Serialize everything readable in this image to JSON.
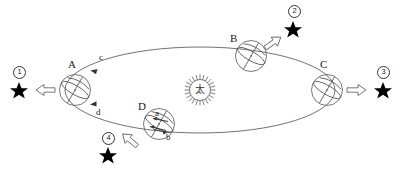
{
  "diagram": {
    "sun": {
      "symbol": "太",
      "label_name": "sun-symbol",
      "cx": 200,
      "cy": 90,
      "r": 13
    },
    "orbit": {
      "cx": 200,
      "cy": 90,
      "rx": 135,
      "ry": 43,
      "stroke": "#4d4d4d"
    },
    "earth_positions": [
      {
        "id": "A",
        "label": "A",
        "cx": 75,
        "cy": 90,
        "r": 16,
        "label_x": 68,
        "label_y": 62
      },
      {
        "id": "B",
        "label": "B",
        "cx": 251,
        "cy": 56,
        "r": 16,
        "label_x": 231,
        "label_y": 36
      },
      {
        "id": "C",
        "label": "C",
        "cx": 327,
        "cy": 90,
        "r": 16,
        "label_x": 320,
        "label_y": 62
      },
      {
        "id": "D",
        "label": "D",
        "cx": 159,
        "cy": 124,
        "r": 16,
        "label_x": 139,
        "label_y": 104
      }
    ],
    "stars": [
      {
        "number": "①",
        "num_text": "1",
        "x": 19,
        "y": 90,
        "num_x": 14,
        "num_y": 68,
        "arrow": "left"
      },
      {
        "number": "②",
        "num_text": "2",
        "x": 293,
        "y": 29,
        "num_x": 289,
        "num_y": 8,
        "arrow": "up-right"
      },
      {
        "number": "③",
        "num_text": "3",
        "x": 383,
        "y": 90,
        "num_x": 378,
        "num_y": 68,
        "arrow": "right"
      },
      {
        "number": "④",
        "num_text": "4",
        "x": 108,
        "y": 155,
        "num_x": 103,
        "num_y": 134,
        "arrow": "down-left"
      }
    ],
    "orbit_arrows": [
      {
        "label": "c",
        "label_x": 98,
        "label_y": 58,
        "name": "orbit-arrow-c"
      },
      {
        "label": "d",
        "label_x": 96,
        "label_y": 113,
        "name": "orbit-arrow-d"
      }
    ],
    "globe_arrows": [
      {
        "label": "a",
        "label_x": 153,
        "label_y": 110,
        "name": "globe-arrow-a"
      },
      {
        "label": "b",
        "label_x": 167,
        "label_y": 138,
        "name": "globe-arrow-b"
      }
    ],
    "colors": {
      "ink": "#1a1a1a",
      "line": "#4d4d4d",
      "star_fill": "#000000",
      "background": "#ffffff"
    }
  }
}
